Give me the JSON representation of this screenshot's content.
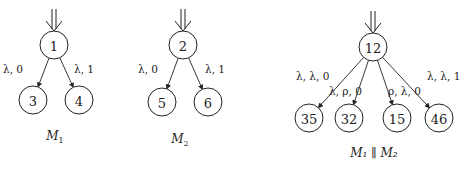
{
  "diagrams": [
    {
      "caption": "M",
      "caption_sub": "1",
      "root": {
        "label": "1",
        "x": 54,
        "y": 45
      },
      "children": [
        {
          "label": "3",
          "x": 33,
          "y": 100,
          "edge_label": "λ, 0",
          "lx": 3,
          "ly": 73
        },
        {
          "label": "4",
          "x": 79,
          "y": 100,
          "edge_label": "λ, 1",
          "lx": 74,
          "ly": 73
        }
      ],
      "caption_pos": {
        "x": 55,
        "y": 140
      }
    },
    {
      "caption": "M",
      "caption_sub": "2",
      "root": {
        "label": "2",
        "x": 183,
        "y": 45
      },
      "children": [
        {
          "label": "5",
          "x": 162,
          "y": 102,
          "edge_label": "λ, 0",
          "lx": 138,
          "ly": 73
        },
        {
          "label": "6",
          "x": 208,
          "y": 102,
          "edge_label": "λ, 1",
          "lx": 205,
          "ly": 73
        }
      ],
      "caption_pos": {
        "x": 180,
        "y": 143
      }
    },
    {
      "caption": "M₁ ∥ M₂",
      "root": {
        "label": "12",
        "x": 373,
        "y": 47
      },
      "children": [
        {
          "label": "35",
          "x": 309,
          "y": 118,
          "edge_label": "λ, λ, 0",
          "lx": 296,
          "ly": 80
        },
        {
          "label": "32",
          "x": 349,
          "y": 118,
          "edge_label": "λ, ρ, 0",
          "lx": 329,
          "ly": 95
        },
        {
          "label": "15",
          "x": 397,
          "y": 118,
          "edge_label": "ρ, λ, 0",
          "lx": 388,
          "ly": 95
        },
        {
          "label": "46",
          "x": 439,
          "y": 118,
          "edge_label": "λ, λ, 1",
          "lx": 427,
          "ly": 80
        }
      ],
      "caption_pos": {
        "x": 374,
        "y": 157
      }
    }
  ],
  "node_radius": 14,
  "colors": {
    "stroke": "#222222",
    "background": "#ffffff"
  }
}
